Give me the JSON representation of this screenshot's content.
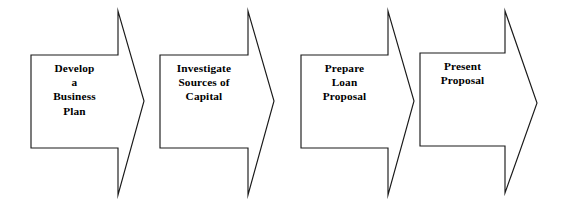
{
  "diagram": {
    "type": "chevron-process-flow",
    "background_color": "#ffffff",
    "line_color": "#1a1a1a",
    "text_color": "#000000",
    "steps": [
      {
        "index": 1,
        "label": "Develop\na\nBusiness\nPlan",
        "lines": [
          "Develop",
          "a",
          "Business",
          "Plan"
        ],
        "name": "develop-a-business-plan"
      },
      {
        "index": 2,
        "label": "Investigate\nSources of\nCapital",
        "lines": [
          "Investigate",
          "Sources of",
          "Capital"
        ],
        "name": "investigate-sources-of-capital"
      },
      {
        "index": 3,
        "label": "Prepare\nLoan\nProposal",
        "lines": [
          "Prepare",
          "Loan",
          "Proposal"
        ],
        "name": "prepare-loan-proposal"
      },
      {
        "index": 4,
        "label": "Present\nProposal",
        "lines": [
          "Present",
          "Proposal"
        ],
        "name": "present-proposal"
      }
    ]
  }
}
